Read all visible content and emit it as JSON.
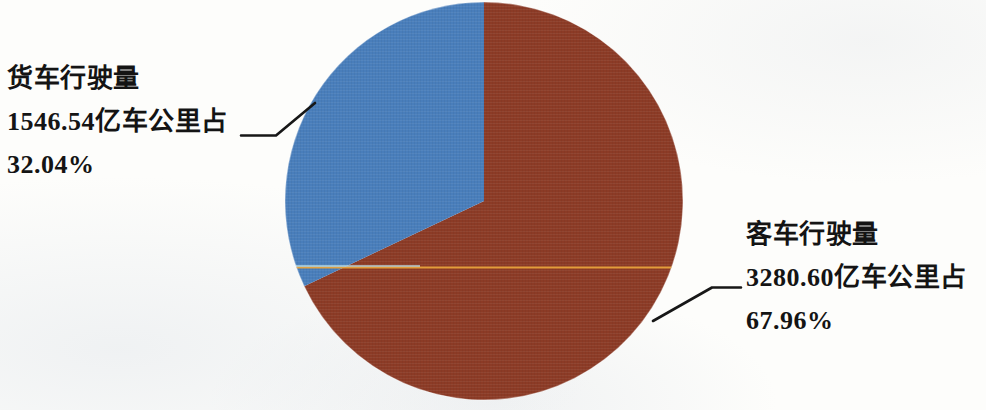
{
  "chart_data": {
    "type": "pie",
    "title": "",
    "subtitle": "",
    "xlabel": "",
    "ylabel": "",
    "legend_position": "none",
    "grid": false,
    "unit": "亿车公里",
    "categories": [
      "客车行驶量",
      "货车行驶量"
    ],
    "values": [
      3280.6,
      1546.54
    ],
    "percentages": [
      67.96,
      32.04
    ],
    "colors": [
      "#8c3a26",
      "#4a7ebb"
    ],
    "slices": [
      {
        "name": "客车行驶量",
        "value": 3280.6,
        "value_text": "3280.60",
        "unit": "亿车公里",
        "percent": 67.96,
        "percent_text": "67.96%",
        "color": "#8c3a26",
        "label_lines": [
          "客车行驶量",
          "3280.60亿车公里占",
          "67.96%"
        ],
        "label_side": "right"
      },
      {
        "name": "货车行驶量",
        "value": 1546.54,
        "value_text": "1546.54",
        "unit": "亿车公里",
        "percent": 32.04,
        "percent_text": "32.04%",
        "color": "#4a7ebb",
        "label_lines": [
          "货车行驶量",
          "1546.54亿车公里占",
          "32.04%"
        ],
        "label_side": "left"
      }
    ],
    "start_angle_deg": 0,
    "direction": "clockwise",
    "annotations": [
      {
        "name": "orange-rule",
        "color": "#e8a33d",
        "y": 267
      }
    ]
  },
  "labels": {
    "truck": {
      "line1": "货车行驶量",
      "line2": "1546.54亿车公里占",
      "line3": "32.04%"
    },
    "bus": {
      "line1": "客车行驶量",
      "line2": "3280.60亿车公里占",
      "line3": "67.96%"
    }
  },
  "geometry": {
    "center_x": 484,
    "center_y": 201,
    "radius": 199
  }
}
